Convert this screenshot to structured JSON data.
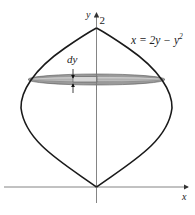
{
  "diagram": {
    "axes": {
      "x_label": "x",
      "y_label": "y",
      "y_tick_label": "2"
    },
    "curve_label": "x = 2y − y",
    "curve_label_exponent": "2",
    "slice_label": "dy",
    "colors": {
      "curve": "#1a1a1a",
      "axis": "#6e6e6e",
      "disk_fill": "#9a9a9a",
      "disk_inner": "#c8c8c8",
      "background": "#ffffff"
    }
  }
}
